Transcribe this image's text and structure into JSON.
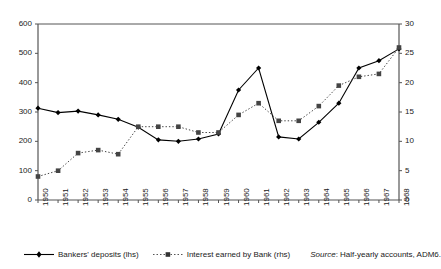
{
  "chart_data": {
    "type": "line",
    "title": "",
    "xlabel": "",
    "ylabel": "",
    "categories": [
      "1950",
      "1951",
      "1952",
      "1953",
      "1954",
      "1955",
      "1956",
      "1957",
      "1958",
      "1959",
      "1960",
      "1961",
      "1962",
      "1963",
      "1964",
      "1965",
      "1966",
      "1967",
      "1968"
    ],
    "grid": false,
    "legend_position": "bottom-left",
    "axes": {
      "left": {
        "ticks": [
          0,
          100,
          200,
          300,
          400,
          500,
          600
        ],
        "tick_labels": [
          "0",
          "100",
          "200",
          "300",
          "400",
          "500",
          "600"
        ],
        "ylim": [
          0,
          600
        ],
        "side": "left"
      },
      "right": {
        "ticks": [
          0,
          5,
          10,
          15,
          20,
          25,
          30
        ],
        "tick_labels": [
          "0",
          "5",
          "10",
          "15",
          "20",
          "25",
          "30"
        ],
        "ylim": [
          0,
          30
        ],
        "side": "right"
      }
    },
    "series": [
      {
        "name": "Bankers' deposits (lhs)",
        "axis": "left",
        "style": "solid",
        "marker": "diamond",
        "color": "#000000",
        "values": [
          313,
          298,
          303,
          290,
          275,
          248,
          205,
          200,
          208,
          225,
          375,
          450,
          215,
          208,
          265,
          330,
          450,
          475,
          515
        ]
      },
      {
        "name": "Interest earned by Bank (rhs)",
        "axis": "right",
        "style": "dotted",
        "marker": "square",
        "color": "#444444",
        "values": [
          4,
          5,
          8,
          8.5,
          7.8,
          12.5,
          12.5,
          12.5,
          11.5,
          11.5,
          14.5,
          16.5,
          13.5,
          13.5,
          16,
          19.5,
          21,
          21.5,
          26
        ]
      }
    ],
    "source_label": "Source",
    "source_text": ": Half-yearly accounts, ADM6."
  }
}
